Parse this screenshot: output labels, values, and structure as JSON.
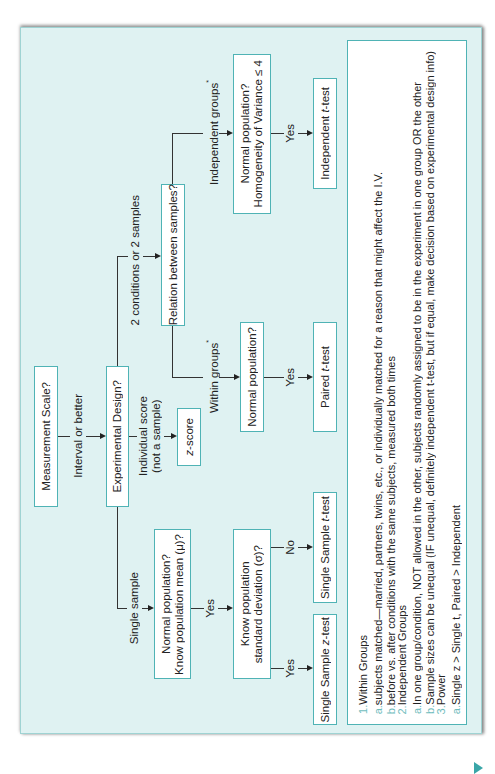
{
  "flowchart": {
    "nodes": {
      "measurement_scale": "Measurement Scale?",
      "experimental_design": "Experimental Design?",
      "z_score_prefix": "z",
      "z_score_suffix": "-score",
      "relation_between_samples": "Relation between samples?",
      "normal_population_within": "Normal population?",
      "paired_t_prefix": "Paired ",
      "paired_t_italic": "t",
      "paired_t_suffix": "-test",
      "normal_population_independent_line1": "Normal population?",
      "normal_population_independent_line2": "Homogeneity of Variance ≤ 4",
      "independent_t_prefix": "Independent ",
      "independent_t_italic": "t",
      "independent_t_suffix": "-test",
      "normal_population_single_line1": "Normal population?",
      "normal_population_single_line2": "Know population mean (μ)?",
      "know_sd_line1": "Know population",
      "know_sd_line2": "standard deviation (σ)?",
      "single_t_prefix": "Single Sample ",
      "single_t_italic": "t",
      "single_t_suffix": "-test",
      "single_z_prefix": "Single Sample ",
      "single_z_italic": "z",
      "single_z_suffix": "-test"
    },
    "edges": {
      "interval_or_better": "Interval or better",
      "individual_score_line1": "Individual score",
      "individual_score_line2": "(not a sample)",
      "two_conditions": "2 conditions or 2 samples",
      "single_sample": "Single sample",
      "within_groups": "Within groups",
      "independent_groups": "Independent groups",
      "asterisk": "*",
      "yes": "Yes",
      "no": "No"
    }
  },
  "notes": {
    "items": [
      {
        "marker": "1.",
        "text": "Within Groups",
        "level": 0
      },
      {
        "marker": "a.",
        "text": "subjects matched—married, partners, twins, etc., or individually matched for a reason that might affect the I.V.",
        "level": 1
      },
      {
        "marker": "b.",
        "text": "before vs. after conditions with the same subjects, measured both times",
        "level": 1
      },
      {
        "marker": "2.",
        "text": "Independent Groups",
        "level": 0
      },
      {
        "marker": "a.",
        "text": "In one group/condition, NOT allowed in the other, subjects randomly assigned to be in the experiment in one group OR the other",
        "level": 1
      },
      {
        "marker": "b.",
        "text": "Sample sizes can be unequal (IF unequal, definitely independent t-test, but if equal, make decision based on experimental design info)",
        "level": 1
      },
      {
        "marker": "3.",
        "text": "Power",
        "level": 0
      },
      {
        "marker": "a.",
        "text": "Single z > Single t, Paired > Independent",
        "level": 1
      }
    ]
  },
  "colors": {
    "panel_bg": "#dff2f2",
    "box_border": "#4fb3b5",
    "marker": "#6fbcbd"
  }
}
